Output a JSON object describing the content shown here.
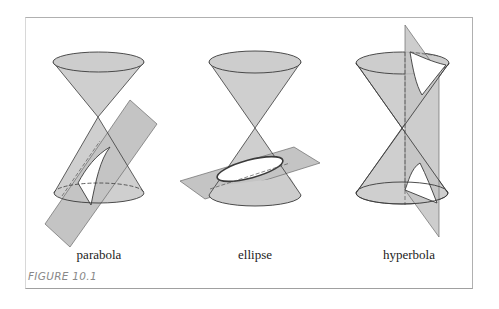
{
  "figure": {
    "caption": "FIGURE 10.1",
    "panels": [
      {
        "id": "parabola",
        "label": "parabola"
      },
      {
        "id": "ellipse",
        "label": "ellipse"
      },
      {
        "id": "hyperbola",
        "label": "hyperbola"
      }
    ],
    "colors": {
      "cone_fill": "#cfcfcf",
      "plane_fill": "#c4c4c4",
      "outline": "#3a3a3a",
      "section_fill": "#ffffff",
      "frame": "#b0b0b0",
      "caption": "#888888"
    }
  }
}
